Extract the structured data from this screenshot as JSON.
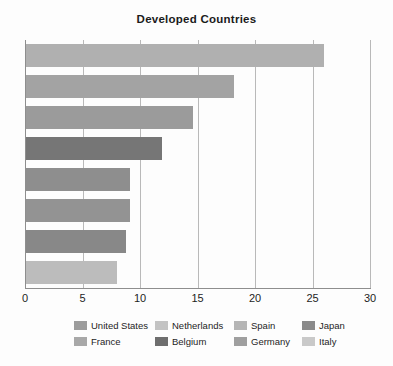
{
  "chart_data": {
    "type": "bar",
    "orientation": "horizontal",
    "title": "Developed Countries",
    "xlabel": "",
    "ylabel": "",
    "xlim": [
      0,
      30
    ],
    "xticks": [
      0,
      5,
      10,
      15,
      20,
      25,
      30
    ],
    "xtick_labels": [
      "0",
      "5",
      "10",
      "15",
      "20",
      "25",
      "30"
    ],
    "grid": "vertical",
    "legend_position": "bottom",
    "categories": [
      "United States",
      "France",
      "Netherlands",
      "Belgium",
      "Spain",
      "Germany",
      "Japan",
      "Italy"
    ],
    "values": [
      26.0,
      18.2,
      14.6,
      11.9,
      9.1,
      9.1,
      8.8,
      8.0
    ],
    "bars": [
      {
        "label": "United States",
        "value": 26.0,
        "color": "#b0b0b0"
      },
      {
        "label": "France",
        "value": 18.2,
        "color": "#a3a3a3"
      },
      {
        "label": "Netherlands",
        "value": 14.6,
        "color": "#9b9b9b"
      },
      {
        "label": "Belgium",
        "value": 11.9,
        "color": "#767676"
      },
      {
        "label": "Spain",
        "value": 9.1,
        "color": "#8e8e8e"
      },
      {
        "label": "Germany",
        "value": 9.1,
        "color": "#939393"
      },
      {
        "label": "Japan",
        "value": 8.8,
        "color": "#888888"
      },
      {
        "label": "Italy",
        "value": 8.0,
        "color": "#bcbcbc"
      }
    ],
    "legend": [
      {
        "label": "United States",
        "color": "#9c9c9c"
      },
      {
        "label": "Netherlands",
        "color": "#c3c3c3"
      },
      {
        "label": "Spain",
        "color": "#b5b5b5"
      },
      {
        "label": "Japan",
        "color": "#8a8a8a"
      },
      {
        "label": "France",
        "color": "#a8a8a8"
      },
      {
        "label": "Belgium",
        "color": "#6e6e6e"
      },
      {
        "label": "Germany",
        "color": "#9f9f9f"
      },
      {
        "label": "Italy",
        "color": "#c9c9c9"
      }
    ],
    "colors": {
      "axis": "#8e8e8e",
      "gridline": "#b9b9b9",
      "text": "#1d1d1d",
      "background": "#fdfdfd"
    }
  }
}
